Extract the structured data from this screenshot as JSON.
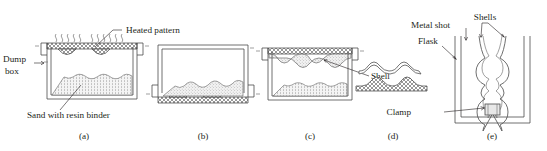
{
  "figure": {
    "panels": [
      {
        "id": "a",
        "caption": "(a)",
        "description": "Dump box with sand and resin binder, heated pattern placed on top"
      },
      {
        "id": "b",
        "caption": "(b)",
        "description": "Box inverted, sand falls onto heated pattern"
      },
      {
        "id": "c",
        "caption": "(c)",
        "description": "Box righted, shell cured on pattern"
      },
      {
        "id": "d",
        "caption": "(d)",
        "description": "Shell stripped from pattern"
      },
      {
        "id": "e",
        "caption": "(e)",
        "description": "Shells assembled in flask supported by metal shot"
      }
    ]
  },
  "labels": {
    "heated_pattern": "Heated pattern",
    "dump_box_line1": "Dump",
    "dump_box_line2": "box",
    "sand_with_resin_binder": "Sand with resin binder",
    "shell": "Shell",
    "shells": "Shells",
    "metal_shot": "Metal shot",
    "flask": "Flask",
    "clamp": "Clamp"
  },
  "captions": {
    "a": "(a)",
    "b": "(b)",
    "c": "(c)",
    "d": "(d)",
    "e": "(e)"
  },
  "colors": {
    "ink": "#231f20",
    "line": "#404040",
    "pattern_fill": "#8c8c8c",
    "sand_fill": "#c9c9c9",
    "background": "#ffffff"
  }
}
